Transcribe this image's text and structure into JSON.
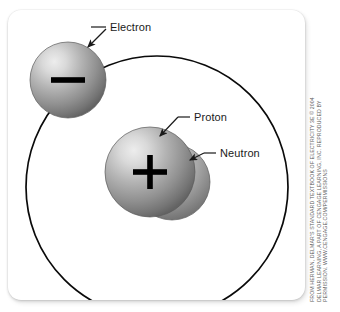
{
  "figure": {
    "name": "atom-structure-diagram",
    "alt_title": "Atom with electron orbiting a nucleus of one proton and one neutron"
  },
  "labels": {
    "electron": "Electron",
    "proton": "Proton",
    "neutron": "Neutron"
  },
  "charges": {
    "electron_symbol": "−",
    "proton_symbol": "+"
  },
  "credit": {
    "line1": "FROM HERMAN, DELMAR'S STANDARD TEXTBOOK OF ELECTRICITY 3E © 2004",
    "line2": "DELMAR LEARNING, A PART OF CENGAGE LEARNING, INC. REPRODUCED BY",
    "line3": "PERMISSION. WWW.CENGAGE.COM/PERMISSIONS"
  },
  "colors": {
    "panel_background": "#ffffff",
    "page_background": "#ffffff",
    "orbit_stroke": "#000000",
    "sphere_highlight": "#e8e8e8",
    "sphere_mid": "#a9a9a9",
    "sphere_edge": "#5e5e5e",
    "charge_symbol": "#000000",
    "label_text": "#1a1a1a",
    "credit_text": "#5c5c5c"
  },
  "geometry": {
    "orbit": {
      "cx": 149,
      "cy": 177,
      "r": 131
    },
    "electron": {
      "cx": 60,
      "cy": 70,
      "r": 38
    },
    "proton": {
      "cx": 142,
      "cy": 162,
      "r": 45
    },
    "neutron": {
      "cx": 164,
      "cy": 172,
      "r": 38
    }
  }
}
